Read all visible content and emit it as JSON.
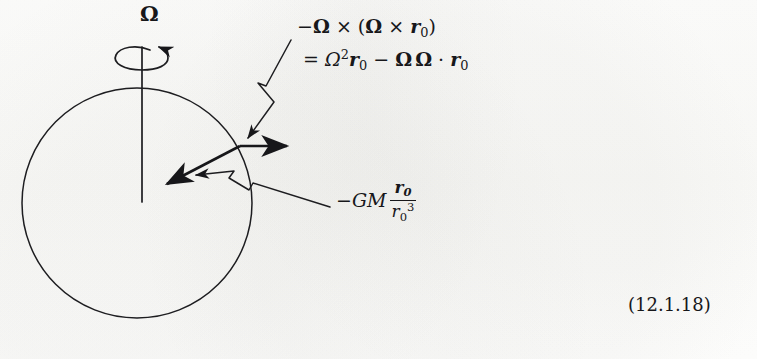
{
  "figure": {
    "kind": "physics-vector-diagram",
    "ink_color": "#17171a",
    "paper_color": "#fdfdfc"
  },
  "labels": {
    "omega_axis": {
      "symbol": "Ω",
      "name": "angular-velocity-vector"
    },
    "centrifugal": {
      "line1": {
        "minus": "−",
        "omega1": "Ω",
        "cross1": "×",
        "open_paren": "(",
        "omega2": "Ω",
        "cross2": "×",
        "r": "r",
        "r_sub": "0",
        "close_paren": ")"
      },
      "line2": {
        "equals": "=",
        "omega_scalar": "Ω",
        "omega_exp": "2",
        "r1": "r",
        "r1_sub": "0",
        "minus": "−",
        "omega_a": "Ω",
        "omega_b": "Ω",
        "dot": "·",
        "r2": "r",
        "r2_sub": "0"
      },
      "plain_text": "−Ω × (Ω × r₀) = Ω²r₀ − Ω Ω · r₀"
    },
    "gravity": {
      "minus": "−",
      "G": "G",
      "M": "M",
      "numerator_r": "r",
      "numerator_sub": "0",
      "denominator_r": "r",
      "denominator_sub": "0",
      "denominator_sup": "3",
      "plain_text": "−GM r₀/r₀³"
    },
    "equation_number": "(12.1.18)"
  },
  "geometry": {
    "sphere": {
      "cx": 137,
      "cy": 203,
      "r": 115
    },
    "spin_axis": {
      "x": 142,
      "y_top": 47,
      "y_bottom": 202
    },
    "rotation_arrow": {
      "cx": 142,
      "cy": 58,
      "rx": 27,
      "ry": 11
    },
    "vector_origin": {
      "x": 240,
      "y": 146
    },
    "centrifugal_vector_tip": {
      "x": 291,
      "y": 146
    },
    "gravity_vector_tip": {
      "x": 163,
      "y": 186
    },
    "leader_top": {
      "from_x": 287,
      "from_y": 42,
      "to_x": 243,
      "to_y": 141
    },
    "leader_bottom": {
      "from_x": 326,
      "from_y": 205,
      "to_x": 192,
      "to_y": 173
    }
  }
}
